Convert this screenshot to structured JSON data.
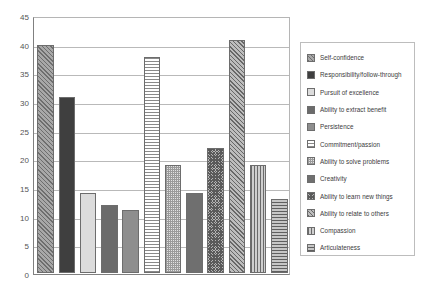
{
  "chart_data": {
    "type": "bar",
    "title": "",
    "xlabel": "",
    "ylabel": "",
    "ylim": [
      0,
      45
    ],
    "ytick_step": 5,
    "yticks": [
      "0",
      "5",
      "10",
      "15",
      "20",
      "25",
      "30",
      "35",
      "40",
      "45"
    ],
    "grid": true,
    "legend_position": "right",
    "categories": [
      "Self-confidence",
      "Responsibility/follow-through",
      "Pursuit of excellence",
      "Ability to extract benefit",
      "Persistence",
      "Commitment/passion",
      "Ability to solve problems",
      "Creativity",
      "Ability to learn new things",
      "Ability to relate to others",
      "Compassion",
      "Articulateness"
    ],
    "values": [
      40,
      31,
      14,
      12,
      11,
      38,
      19,
      14,
      22,
      41,
      19,
      13
    ],
    "series": [
      {
        "name": "",
        "values": [
          40,
          31,
          14,
          12,
          11,
          38,
          19,
          14,
          22,
          41,
          19,
          13
        ]
      }
    ]
  },
  "legend": {
    "items": [
      {
        "label": "Self-confidence",
        "pattern": "diagonal-hatch-dense",
        "color": "#a8a8a8"
      },
      {
        "label": "Responsibility/follow-through",
        "pattern": "solid",
        "color": "#3f3f3f"
      },
      {
        "label": "Pursuit of excellence",
        "pattern": "solid",
        "color": "#dcdcdc"
      },
      {
        "label": "Ability to extract benefit",
        "pattern": "solid",
        "color": "#6b6b6b"
      },
      {
        "label": "Persistence",
        "pattern": "solid",
        "color": "#8e8e8e"
      },
      {
        "label": "Commitment/passion",
        "pattern": "horizontal-lines",
        "color": "#ffffff"
      },
      {
        "label": "Ability to solve problems",
        "pattern": "fine-checker",
        "color": "#e2e2e2"
      },
      {
        "label": "Creativity",
        "pattern": "solid",
        "color": "#6f6f6f"
      },
      {
        "label": "Ability to learn new things",
        "pattern": "cross-hatch-dense",
        "color": "#b4b4b4"
      },
      {
        "label": "Ability to relate to others",
        "pattern": "diagonal-hatch",
        "color": "#bdbdbd"
      },
      {
        "label": "Compassion",
        "pattern": "vertical-lines",
        "color": "#cfcfcf"
      },
      {
        "label": "Articulateness",
        "pattern": "horizontal-lines-dark",
        "color": "#c6c6c6"
      }
    ]
  }
}
